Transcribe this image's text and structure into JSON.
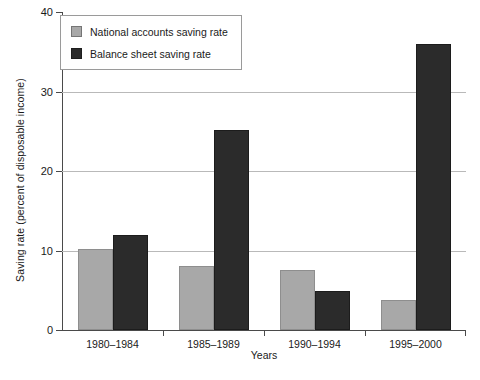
{
  "chart_data": {
    "type": "bar",
    "title": "",
    "xlabel": "Years",
    "ylabel": "Saving rate (percent of disposable income)",
    "categories": [
      "1980–1984",
      "1985–1989",
      "1990–1994",
      "1995–2000"
    ],
    "series": [
      {
        "name": "National accounts saving rate",
        "color": "#a8a8a8",
        "values": [
          10.2,
          8.0,
          7.5,
          3.8
        ]
      },
      {
        "name": "Balance sheet saving rate",
        "color": "#2b2b2b",
        "values": [
          12.0,
          25.1,
          4.9,
          36.0
        ]
      }
    ],
    "ylim": [
      0,
      40
    ],
    "yticks": [
      0,
      10,
      20,
      30,
      40
    ],
    "ytick_labels": [
      "0",
      "10",
      "20",
      "30",
      "40"
    ],
    "grid": "horizontal",
    "gridlines_at": [
      10,
      20,
      30
    ],
    "legend_position": "top-left"
  }
}
